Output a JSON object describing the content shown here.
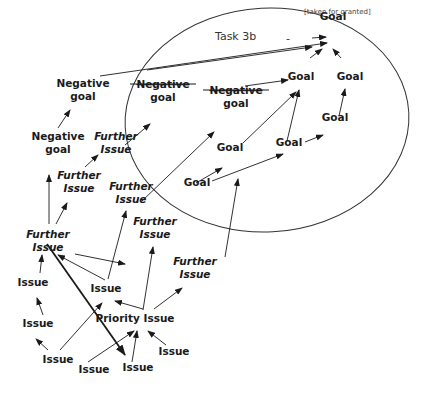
{
  "diagram": {
    "title": "Task 3b",
    "annotation": "[taken for granted]",
    "minus_sign": "-",
    "nodes": [
      {
        "id": "g_top",
        "text": [
          "Goal"
        ],
        "x": 333,
        "y": 20,
        "style": "normal"
      },
      {
        "id": "g1",
        "text": [
          "Goal"
        ],
        "x": 301,
        "y": 80,
        "style": "normal"
      },
      {
        "id": "g2",
        "text": [
          "Goal"
        ],
        "x": 350,
        "y": 80,
        "style": "normal"
      },
      {
        "id": "g3",
        "text": [
          "Goal"
        ],
        "x": 335,
        "y": 121,
        "style": "normal"
      },
      {
        "id": "g4",
        "text": [
          "Goal"
        ],
        "x": 289,
        "y": 146,
        "style": "normal"
      },
      {
        "id": "g5",
        "text": [
          "Goal"
        ],
        "x": 230,
        "y": 151,
        "style": "normal"
      },
      {
        "id": "g6",
        "text": [
          "Goal"
        ],
        "x": 197,
        "y": 186,
        "style": "normal"
      },
      {
        "id": "ng_s1",
        "text": [
          "Negative",
          "goal"
        ],
        "x": 163,
        "y": 88,
        "style": "struck"
      },
      {
        "id": "ng_s2",
        "text": [
          "Negative",
          "goal"
        ],
        "x": 236,
        "y": 94,
        "style": "struck"
      },
      {
        "id": "ng1",
        "text": [
          "Negative",
          "goal"
        ],
        "x": 83,
        "y": 87,
        "style": "normal"
      },
      {
        "id": "ng2",
        "text": [
          "Negative",
          "goal"
        ],
        "x": 58,
        "y": 140,
        "style": "normal"
      },
      {
        "id": "fi1",
        "text": [
          "Further",
          "Issue"
        ],
        "x": 116,
        "y": 140,
        "style": "italic"
      },
      {
        "id": "fi2",
        "text": [
          "Further",
          "Issue"
        ],
        "x": 79,
        "y": 179,
        "style": "italic"
      },
      {
        "id": "fi3",
        "text": [
          "Further",
          "Issue"
        ],
        "x": 131,
        "y": 190,
        "style": "italic"
      },
      {
        "id": "fi4",
        "text": [
          "Further",
          "Issue"
        ],
        "x": 155,
        "y": 225,
        "style": "italic"
      },
      {
        "id": "fi5",
        "text": [
          "Further",
          "Issue"
        ],
        "x": 48,
        "y": 238,
        "style": "italic"
      },
      {
        "id": "fi6",
        "text": [
          "Further",
          "Issue"
        ],
        "x": 195,
        "y": 265,
        "style": "italic"
      },
      {
        "id": "is1",
        "text": [
          "Issue"
        ],
        "x": 33,
        "y": 286,
        "style": "normal"
      },
      {
        "id": "is2",
        "text": [
          "Issue"
        ],
        "x": 106,
        "y": 292,
        "style": "normal"
      },
      {
        "id": "is3",
        "text": [
          "Issue"
        ],
        "x": 38,
        "y": 327,
        "style": "normal"
      },
      {
        "id": "pri",
        "text": [
          "Priority Issue"
        ],
        "x": 135,
        "y": 322,
        "style": "normal"
      },
      {
        "id": "is4",
        "text": [
          "Issue"
        ],
        "x": 58,
        "y": 363,
        "style": "normal"
      },
      {
        "id": "is5",
        "text": [
          "Issue"
        ],
        "x": 174,
        "y": 355,
        "style": "normal"
      },
      {
        "id": "is6",
        "text": [
          "Issue"
        ],
        "x": 94,
        "y": 373,
        "style": "normal"
      },
      {
        "id": "is7",
        "text": [
          "Issue"
        ],
        "x": 138,
        "y": 371,
        "style": "normal"
      }
    ],
    "edges": [
      {
        "from": [
          100,
          76
        ],
        "to": [
          327,
          43
        ],
        "bold": false
      },
      {
        "from": [
          147,
          70
        ],
        "to": [
          312,
          47
        ],
        "bold": false
      },
      {
        "from": [
          312,
          38
        ],
        "to": [
          326,
          37
        ],
        "bold": false
      },
      {
        "from": [
          310,
          58
        ],
        "to": [
          322,
          49
        ],
        "bold": false
      },
      {
        "from": [
          341,
          58
        ],
        "to": [
          333,
          49
        ],
        "bold": false
      },
      {
        "from": [
          245,
          86
        ],
        "to": [
          288,
          80
        ],
        "bold": false
      },
      {
        "from": [
          339,
          116
        ],
        "to": [
          345,
          89
        ],
        "bold": false
      },
      {
        "from": [
          305,
          142
        ],
        "to": [
          323,
          135
        ],
        "bold": false
      },
      {
        "from": [
          243,
          143
        ],
        "to": [
          296,
          92
        ],
        "bold": false
      },
      {
        "from": [
          287,
          141
        ],
        "to": [
          299,
          90
        ],
        "bold": false
      },
      {
        "from": [
          212,
          181
        ],
        "to": [
          283,
          154
        ],
        "bold": false
      },
      {
        "from": [
          196,
          183
        ],
        "to": [
          222,
          168
        ],
        "bold": false
      },
      {
        "from": [
          125,
          145
        ],
        "to": [
          150,
          124
        ],
        "bold": false
      },
      {
        "from": [
          142,
          201
        ],
        "to": [
          214,
          132
        ],
        "bold": false
      },
      {
        "from": [
          58,
          128
        ],
        "to": [
          70,
          110
        ],
        "bold": false
      },
      {
        "from": [
          85,
          167
        ],
        "to": [
          98,
          155
        ],
        "bold": false
      },
      {
        "from": [
          56,
          224
        ],
        "to": [
          67,
          203
        ],
        "bold": false
      },
      {
        "from": [
          49,
          224
        ],
        "to": [
          49,
          175
        ],
        "bold": false
      },
      {
        "from": [
          40,
          273
        ],
        "to": [
          42,
          255
        ],
        "bold": false
      },
      {
        "from": [
          43,
          315
        ],
        "to": [
          37,
          298
        ],
        "bold": false
      },
      {
        "from": [
          75,
          254
        ],
        "to": [
          125,
          264
        ],
        "bold": false
      },
      {
        "from": [
          105,
          280
        ],
        "to": [
          58,
          255
        ],
        "bold": false
      },
      {
        "from": [
          108,
          279
        ],
        "to": [
          126,
          211
        ],
        "bold": false
      },
      {
        "from": [
          60,
          350
        ],
        "to": [
          102,
          303
        ],
        "bold": false
      },
      {
        "from": [
          48,
          350
        ],
        "to": [
          36,
          339
        ],
        "bold": false
      },
      {
        "from": [
          143,
          309
        ],
        "to": [
          115,
          301
        ],
        "bold": false
      },
      {
        "from": [
          143,
          310
        ],
        "to": [
          153,
          247
        ],
        "bold": false
      },
      {
        "from": [
          154,
          309
        ],
        "to": [
          182,
          288
        ],
        "bold": false
      },
      {
        "from": [
          225,
          257
        ],
        "to": [
          238,
          179
        ],
        "bold": false
      },
      {
        "from": [
          88,
          362
        ],
        "to": [
          134,
          331
        ],
        "bold": false
      },
      {
        "from": [
          132,
          362
        ],
        "to": [
          137,
          331
        ],
        "bold": false
      },
      {
        "from": [
          166,
          345
        ],
        "to": [
          148,
          331
        ],
        "bold": false
      },
      {
        "from": [
          47,
          244
        ],
        "to": [
          125,
          355
        ],
        "bold": true
      }
    ]
  }
}
